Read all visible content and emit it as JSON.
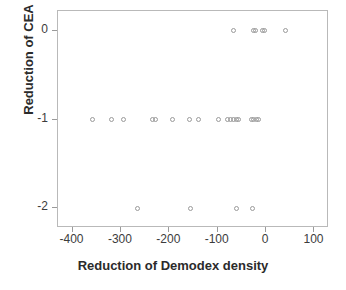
{
  "chart_data": {
    "type": "scatter",
    "title": "",
    "xlabel": "Reduction of Demodex density",
    "ylabel": "Reduction of CEA",
    "xlim": [
      -430,
      130
    ],
    "ylim": [
      -2.22,
      0.22
    ],
    "xticks": [
      -400,
      -300,
      -200,
      -100,
      0,
      100
    ],
    "xticklabels": [
      "-400",
      "-300",
      "-200",
      "-100",
      "0",
      "100"
    ],
    "yticks": [
      0,
      -1,
      -2
    ],
    "yticklabels": [
      "0",
      "-1",
      "-2"
    ],
    "grid": false,
    "legend": null,
    "marker": "open-circle",
    "marker_color": "#9a9a9a",
    "points": [
      {
        "x": -68,
        "y": 0
      },
      {
        "x": -26,
        "y": 0
      },
      {
        "x": -22,
        "y": 0
      },
      {
        "x": -7,
        "y": 0
      },
      {
        "x": -4,
        "y": 0
      },
      {
        "x": 40,
        "y": 0
      },
      {
        "x": -358,
        "y": -1
      },
      {
        "x": -320,
        "y": -1
      },
      {
        "x": -294,
        "y": -1
      },
      {
        "x": -234,
        "y": -1
      },
      {
        "x": -228,
        "y": -1
      },
      {
        "x": -194,
        "y": -1
      },
      {
        "x": -158,
        "y": -1
      },
      {
        "x": -140,
        "y": -1
      },
      {
        "x": -98,
        "y": -1
      },
      {
        "x": -80,
        "y": -1
      },
      {
        "x": -74,
        "y": -1
      },
      {
        "x": -68,
        "y": -1
      },
      {
        "x": -62,
        "y": -1
      },
      {
        "x": -56,
        "y": -1
      },
      {
        "x": -30,
        "y": -1
      },
      {
        "x": -25,
        "y": -1
      },
      {
        "x": -20,
        "y": -1
      },
      {
        "x": -15,
        "y": -1
      },
      {
        "x": -266,
        "y": -2
      },
      {
        "x": -156,
        "y": -2
      },
      {
        "x": -62,
        "y": -2
      },
      {
        "x": -28,
        "y": -2
      }
    ]
  },
  "axes": {
    "frame_color": "#b9b9b9",
    "tick_color": "#9a9a9a",
    "label_color": "#3c3c3c",
    "title_color": "#2b2b2b"
  }
}
